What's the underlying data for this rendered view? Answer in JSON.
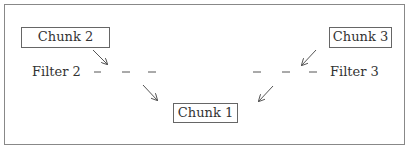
{
  "diagram": {
    "nodes": {
      "chunk1": {
        "label": "Chunk 1"
      },
      "chunk2": {
        "label": "Chunk 2"
      },
      "chunk3": {
        "label": "Chunk 3"
      }
    },
    "filters": {
      "filter2": {
        "label": "Filter 2"
      },
      "filter3": {
        "label": "Filter 3"
      }
    },
    "edges": [
      {
        "from": "Chunk 2",
        "to": "Chunk 1",
        "via": "Filter 2",
        "style": "dashed-arrow"
      },
      {
        "from": "Chunk 3",
        "to": "Chunk 1",
        "via": "Filter 3",
        "style": "dashed-arrow"
      }
    ],
    "colors": {
      "stroke": "#666666",
      "text": "#333333",
      "background": "#ffffff"
    }
  }
}
